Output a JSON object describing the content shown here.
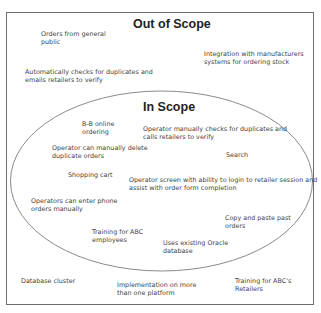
{
  "diagram": {
    "type": "scope-diagram",
    "out_of_scope": {
      "title": "Out of Scope",
      "items": [
        {
          "line1": "Orders from general",
          "line2": "public"
        },
        {
          "line1": "Integration with manufacturers",
          "line2": "systems for ordering stock"
        },
        {
          "line1": "Automatically checks for duplicates and",
          "line2": "emails retailers to verify"
        },
        {
          "line1": "Database cluster",
          "line2": ""
        },
        {
          "line1": "Implementation on more",
          "line2": "than one platform"
        },
        {
          "line1": "Training for ABC's",
          "line2": "Retailers"
        }
      ]
    },
    "in_scope": {
      "title": "In Scope",
      "items": [
        {
          "line1": "B-B online",
          "line2": "ordering"
        },
        {
          "line1": "Operator manually checks for duplicates and",
          "line2": "calls retailers to verify"
        },
        {
          "line1": "Operator can manually delete",
          "line2": "duplicate orders"
        },
        {
          "line1": "Search",
          "line2": ""
        },
        {
          "line1": "Shopping cart",
          "line2": ""
        },
        {
          "line1": "Operator screen with ability to login to retailer session and",
          "line2": "assist with order form completion"
        },
        {
          "line1": "Operators can enter phone",
          "line2": "orders manually"
        },
        {
          "line1": "Copy and paste past",
          "line2": "orders"
        },
        {
          "line1": "Training for ABC",
          "line2": "employees"
        },
        {
          "line1": "Uses existing Oracle",
          "line2": "database"
        }
      ]
    },
    "colors": {
      "border": "#6e6e6e",
      "ellipse": "#8a8a8a",
      "text": "#444444",
      "title": "#222222"
    }
  }
}
